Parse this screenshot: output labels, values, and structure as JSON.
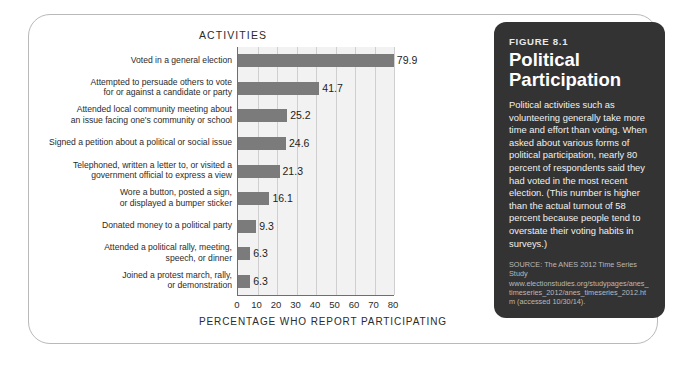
{
  "figure": {
    "eyebrow": "FIGURE 8.1",
    "title_line1": "Political",
    "title_line2": "Participation",
    "body": "Political activities such as volunteering generally take more time and effort than voting. When asked about various forms of political participation, nearly 80 percent of respondents said they had voted in the most recent election. (This number is higher than the actual turnout of 58 percent because people tend to overstate their voting habits in surveys.)",
    "source": "SOURCE: The ANES 2012 Time Series Study www.electionstudies.org/studypages/anes_timeseries_2012/anes_timeseries_2012.htm (accessed 10/30/14).",
    "panel_bg": "#333333",
    "panel_text": "#ffffff"
  },
  "chart_data": {
    "type": "bar",
    "orientation": "horizontal",
    "title": "ACTIVITIES",
    "xlabel": "PERCENTAGE WHO REPORT PARTICIPATING",
    "ylabel": "",
    "xlim": [
      0,
      80
    ],
    "xticks": [
      0,
      10,
      20,
      30,
      40,
      50,
      60,
      70,
      80
    ],
    "xtick_labels": [
      "0",
      "10",
      "20",
      "30",
      "40",
      "50",
      "60",
      "70",
      "80"
    ],
    "grid": "vertical",
    "legend": "none",
    "bar_color": "#7b7b7b",
    "plot_bg": "#f2f2f2",
    "categories": [
      "Voted in a general election",
      "Attempted to persuade others to vote for or against a candidate or party",
      "Attended local community meeting about an issue facing one's community or school",
      "Signed a petition about a political or social issue",
      "Telephoned, written a letter to, or visited a government official to express a view",
      "Wore a button, posted a sign, or displayed a bumper sticker",
      "Donated money to a political party",
      "Attended a political rally, meeting, speech, or dinner",
      "Joined a protest march, rally, or demonstration"
    ],
    "category_lines": [
      [
        "Voted in a general election"
      ],
      [
        "Attempted to persuade others to vote",
        "for or against a candidate or party"
      ],
      [
        "Attended local community meeting about",
        "an issue facing one's community or school"
      ],
      [
        "Signed a petition about a political or social issue"
      ],
      [
        "Telephoned, written a letter to, or visited a",
        "government official to express a view"
      ],
      [
        "Wore a button, posted a sign,",
        "or displayed a bumper sticker"
      ],
      [
        "Donated money to a political party"
      ],
      [
        "Attended a political rally, meeting,",
        "speech, or dinner"
      ],
      [
        "Joined a protest march, rally,",
        "or demonstration"
      ]
    ],
    "values": [
      79.9,
      41.7,
      25.2,
      24.6,
      21.3,
      16.1,
      9.3,
      6.3,
      6.3
    ],
    "value_labels": [
      "79.9",
      "41.7",
      "25.2",
      "24.6",
      "21.3",
      "16.1",
      "9.3",
      "6.3",
      "6.3"
    ]
  }
}
